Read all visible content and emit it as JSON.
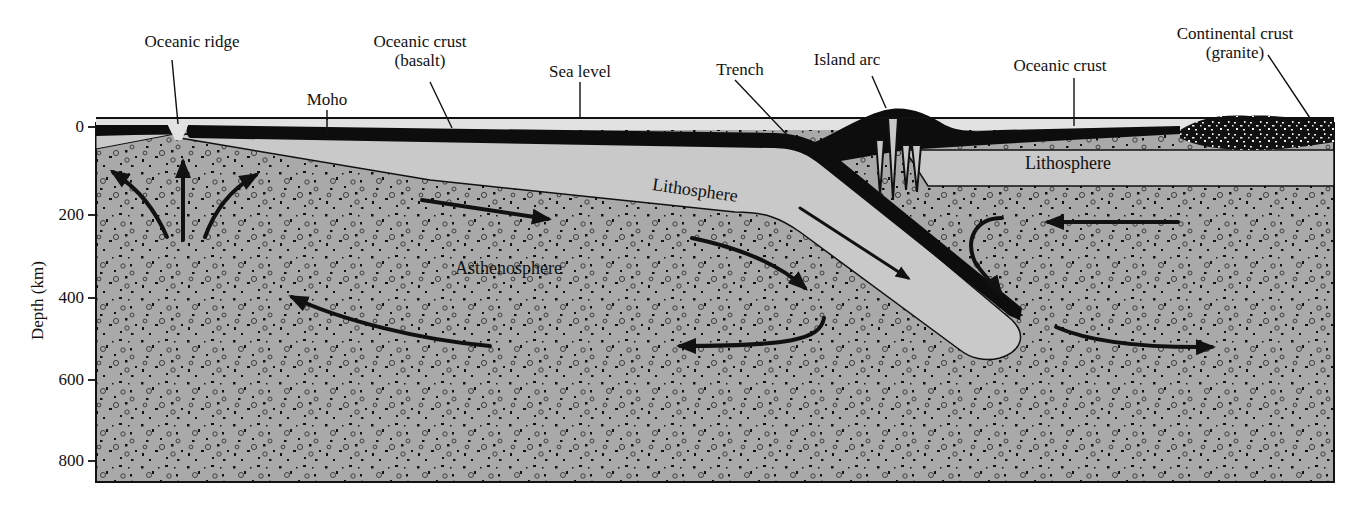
{
  "figure": {
    "type": "cross-section"
  },
  "axis": {
    "title": "Depth (km)",
    "ticks": [
      "0",
      "200",
      "400",
      "600",
      "800"
    ]
  },
  "callouts": {
    "oceanic_ridge": "Oceanic ridge",
    "moho": "Moho",
    "oceanic_crust_basalt_line1": "Oceanic crust",
    "oceanic_crust_basalt_line2": "(basalt)",
    "sea_level": "Sea level",
    "trench": "Trench",
    "island_arc": "Island arc",
    "oceanic_crust": "Oceanic crust",
    "continental_crust_line1": "Continental crust",
    "continental_crust_line2": "(granite)"
  },
  "regions": {
    "lithosphere_left": "Lithosphere",
    "lithosphere_right": "Lithosphere",
    "asthenosphere": "Asthenosphere"
  },
  "colors": {
    "crust": "#0d0d0d",
    "lithosphere": "#c9c9c9",
    "asthenosphere": "#a9a9a9",
    "sea": "#e2e2e2",
    "outline": "#111111"
  }
}
